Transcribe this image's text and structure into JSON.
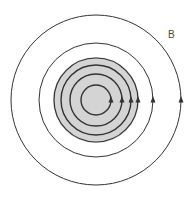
{
  "diagram": {
    "label": "B",
    "center": [
      96,
      100
    ],
    "disc": {
      "radius": 43,
      "fill": "#d4d4d4"
    },
    "field_lines": [
      {
        "radius": 15,
        "stroke_width": 1.4
      },
      {
        "radius": 26,
        "stroke_width": 1.4
      },
      {
        "radius": 35,
        "stroke_width": 1.4
      },
      {
        "radius": 42,
        "stroke_width": 1.2
      },
      {
        "radius": 57,
        "stroke_width": 1.0
      },
      {
        "radius": 85,
        "stroke_width": 1.0
      }
    ],
    "line_color": "#333333",
    "arrow_direction": "up"
  }
}
